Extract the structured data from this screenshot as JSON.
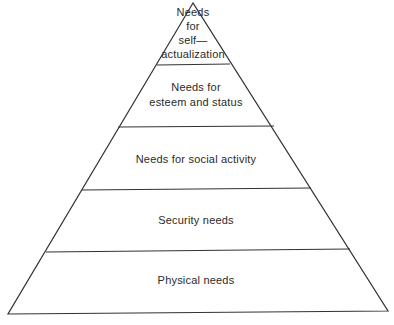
{
  "diagram": {
    "type": "pyramid",
    "title": "",
    "line_color": "#333333",
    "background": "#ffffff",
    "levels": [
      {
        "label": "Needs\nfor\nself—\nactualization",
        "position": "top"
      },
      {
        "label": "Needs for\nesteem and status",
        "position": "second"
      },
      {
        "label": "Needs for social activity",
        "position": "middle"
      },
      {
        "label": "Security needs",
        "position": "fourth"
      },
      {
        "label": "Physical needs",
        "position": "base"
      }
    ]
  }
}
